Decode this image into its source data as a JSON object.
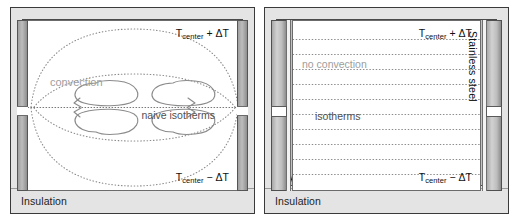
{
  "figure": {
    "panels": [
      {
        "id": "left-panel-convection",
        "insulation_label": "Insulation",
        "aluminum_label": "Aluminum",
        "temp_top": {
          "symbol": "T",
          "subscript": "center",
          "suffix": " + ΔT"
        },
        "temp_bottom": {
          "symbol": "T",
          "subscript": "center",
          "suffix": " − ΔT"
        },
        "annotations": [
          {
            "name": "convection",
            "text": "convection",
            "color": "#9d9d9d"
          },
          {
            "name": "naive-isotherms",
            "text": "naive isotherms",
            "color": "#4f4f4f"
          }
        ]
      },
      {
        "id": "right-panel-no-convection",
        "insulation_label": "Insulation",
        "aluminum_label": "Aluminum",
        "temp_top": {
          "symbol": "T",
          "subscript": "center",
          "suffix": " + ΔT"
        },
        "temp_bottom": {
          "symbol": "T",
          "subscript": "center",
          "suffix": " − ΔT"
        },
        "side_material_label": "Stainless steel",
        "annotations": [
          {
            "name": "no-convection",
            "text": "no convection",
            "color": "#9d9d9d"
          },
          {
            "name": "isotherms",
            "text": "isotherms",
            "color": "#4f4f4f"
          }
        ]
      }
    ],
    "colors": {
      "insulation": "#e4e4e4",
      "aluminum": "#c2c2c2",
      "cavity": "#ffffff",
      "stainless_steel": "#bdbdbd",
      "isotherm_stroke": "#8a8a8a",
      "flow_stroke": "#8b8b8b",
      "text": "#111111",
      "soft_text": "#9d9d9d"
    }
  }
}
